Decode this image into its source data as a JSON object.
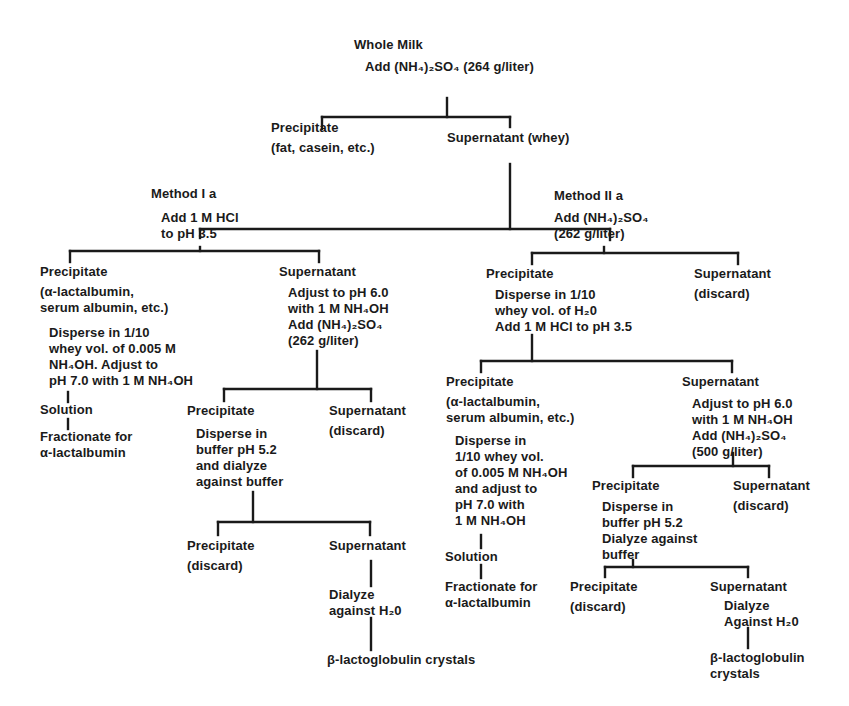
{
  "diagram": {
    "type": "flowchart-tree",
    "line_color": "#1a1a1a",
    "background": "#ffffff",
    "nodes": {
      "root": {
        "lines": [
          "Whole Milk"
        ]
      },
      "root_step": {
        "lines": [
          "Add (NH₄)₂SO₄ (264 g/liter)"
        ]
      },
      "l1_precip": {
        "lines": [
          "Precipitate",
          "(fat, casein, etc.)"
        ]
      },
      "l1_super": {
        "lines": [
          "Supernatant (whey)"
        ]
      },
      "m1": {
        "lines": [
          "Method I a"
        ]
      },
      "m1_step": {
        "lines": [
          "Add 1 M HCl",
          "to pH 3.5"
        ]
      },
      "m1_precip": {
        "lines": [
          "Precipitate",
          "(α-lactalbumin,",
          "serum albumin, etc.)"
        ]
      },
      "m1_precip_step": {
        "lines": [
          "Disperse in 1/10",
          "whey vol. of 0.005 M",
          "NH₄OH.  Adjust to",
          "pH 7.0 with 1 M NH₄OH"
        ]
      },
      "m1_solution": {
        "lines": [
          "Solution"
        ]
      },
      "m1_fractionate": {
        "lines": [
          "Fractionate for",
          "α-lactalbumin"
        ]
      },
      "m1_super": {
        "lines": [
          "Supernatant"
        ]
      },
      "m1_super_step": {
        "lines": [
          "Adjust to pH 6.0",
          "with 1 M NH₄OH",
          "Add (NH₄)₂SO₄",
          "(262 g/liter)"
        ]
      },
      "m1_p2": {
        "lines": [
          "Precipitate"
        ]
      },
      "m1_p2_step": {
        "lines": [
          "Disperse in",
          "buffer pH 5.2",
          "and dialyze",
          "against buffer"
        ]
      },
      "m1_s2": {
        "lines": [
          "Supernatant",
          "(discard)"
        ]
      },
      "m1_p3": {
        "lines": [
          "Precipitate",
          "(discard)"
        ]
      },
      "m1_s3": {
        "lines": [
          "Supernatant"
        ]
      },
      "m1_dialyze": {
        "lines": [
          "Dialyze",
          "against H₂0"
        ]
      },
      "m1_crystals": {
        "lines": [
          "β-lactoglobulin crystals"
        ]
      },
      "m2": {
        "lines": [
          "Method II a"
        ]
      },
      "m2_step": {
        "lines": [
          "Add (NH₄)₂SO₄",
          "(262 g/liter)"
        ]
      },
      "m2_precip": {
        "lines": [
          "Precipitate"
        ]
      },
      "m2_precip_step": {
        "lines": [
          "Disperse in 1/10",
          "whey vol. of H₂0",
          "Add 1 M HCl to pH 3.5"
        ]
      },
      "m2_super": {
        "lines": [
          "Supernatant",
          "(discard)"
        ]
      },
      "m2_p2": {
        "lines": [
          "Precipitate",
          "(α-lactalbumin,",
          "serum albumin, etc.)"
        ]
      },
      "m2_p2_step": {
        "lines": [
          "Disperse in",
          "1/10 whey vol.",
          "of 0.005 M NH₄OH",
          "and adjust to",
          "pH 7.0 with",
          "1 M NH₄OH"
        ]
      },
      "m2_solution": {
        "lines": [
          "Solution"
        ]
      },
      "m2_fractionate": {
        "lines": [
          "Fractionate for",
          "α-lactalbumin"
        ]
      },
      "m2_s2": {
        "lines": [
          "Supernatant"
        ]
      },
      "m2_s2_step": {
        "lines": [
          "Adjust to pH 6.0",
          "with 1 M NH₄OH",
          "Add (NH₄)₂SO₄",
          "(500 g/liter)"
        ]
      },
      "m2_p3": {
        "lines": [
          "Precipitate"
        ]
      },
      "m2_p3_step": {
        "lines": [
          "Disperse in",
          "buffer pH 5.2",
          "Dialyze against",
          "buffer"
        ]
      },
      "m2_s3": {
        "lines": [
          "Supernatant",
          "(discard)"
        ]
      },
      "m2_p4": {
        "lines": [
          "Precipitate",
          "(discard)"
        ]
      },
      "m2_s4": {
        "lines": [
          "Supernatant"
        ]
      },
      "m2_dialyze": {
        "lines": [
          "Dialyze",
          "Against H₂0"
        ]
      },
      "m2_crystals": {
        "lines": [
          "β-lactoglobulin",
          "crystals"
        ]
      }
    }
  }
}
